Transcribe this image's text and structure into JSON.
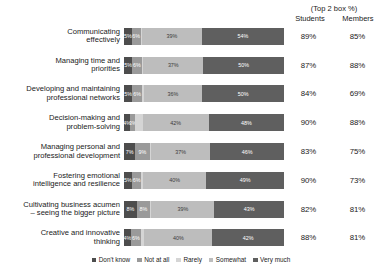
{
  "header": {
    "top_label": "(Top 2 box %)",
    "col_students": "Students",
    "col_members": "Members"
  },
  "legend": {
    "items": [
      {
        "label": "Don't know",
        "color": "#4d4d4d"
      },
      {
        "label": "Not at all",
        "color": "#9a9a9a"
      },
      {
        "label": "Rarely",
        "color": "#d5d5d5"
      },
      {
        "label": "Somewhat",
        "color": "#bdbdbd"
      },
      {
        "label": "Very much",
        "color": "#5f5f5f"
      }
    ]
  },
  "chart_data": {
    "type": "bar",
    "subtype": "100% stacked horizontal bar",
    "title": "",
    "xlabel": "",
    "ylabel": "",
    "xlim": [
      0,
      100
    ],
    "grid": false,
    "legend_position": "bottom",
    "categories": [
      "Communicating effectively",
      "Managing time and priorities",
      "Developing and maintaining professional networks",
      "Decision-making and problem-solving",
      "Managing personal and professional development",
      "Fostering emotional intelligence and resilience",
      "Cultivating business acumen – seeing the bigger picture",
      "Creative and innovative thinking"
    ],
    "category_lines": [
      [
        "Communicating",
        "effectively"
      ],
      [
        "Managing time and",
        "priorities"
      ],
      [
        "Developing and maintaining",
        "professional networks"
      ],
      [
        "Decision-making and",
        "problem-solving"
      ],
      [
        "Managing personal and",
        "professional development"
      ],
      [
        "Fostering emotional",
        "intelligence and resilience"
      ],
      [
        "Cultivating business acumen",
        "– seeing the bigger picture"
      ],
      [
        "Creative and innovative",
        "thinking"
      ]
    ],
    "series": [
      {
        "name": "Don't know",
        "values": [
          5,
          5,
          5,
          4,
          7,
          5,
          8,
          4
        ]
      },
      {
        "name": "Not at all",
        "values": [
          6,
          6,
          6,
          3,
          9,
          6,
          8,
          6
        ]
      },
      {
        "name": "Rarely",
        "values": [
          1,
          1,
          1,
          5,
          1,
          1,
          1,
          2
        ]
      },
      {
        "name": "Somewhat",
        "values": [
          39,
          37,
          36,
          42,
          37,
          40,
          39,
          40
        ]
      },
      {
        "name": "Very much",
        "values": [
          54,
          50,
          50,
          48,
          46,
          49,
          43,
          42
        ]
      }
    ],
    "bar_labels": [
      [
        "5%",
        "6%",
        "",
        "39%",
        "54%"
      ],
      [
        "5%",
        "6%",
        "",
        "37%",
        "50%"
      ],
      [
        "5%",
        "6%",
        "",
        "36%",
        "50%"
      ],
      [
        "4%",
        "3%",
        "",
        "42%",
        "48%"
      ],
      [
        "7%",
        "9%",
        "",
        "37%",
        "46%"
      ],
      [
        "5%",
        "6%",
        "",
        "40%",
        "49%"
      ],
      [
        "8%",
        "8%",
        "",
        "39%",
        "43%"
      ],
      [
        "4%",
        "6%",
        "",
        "40%",
        "42%"
      ]
    ],
    "top2box": {
      "students": [
        "89%",
        "87%",
        "84%",
        "90%",
        "83%",
        "90%",
        "82%",
        "88%"
      ],
      "members": [
        "85%",
        "88%",
        "69%",
        "88%",
        "75%",
        "73%",
        "81%",
        "81%"
      ]
    }
  }
}
